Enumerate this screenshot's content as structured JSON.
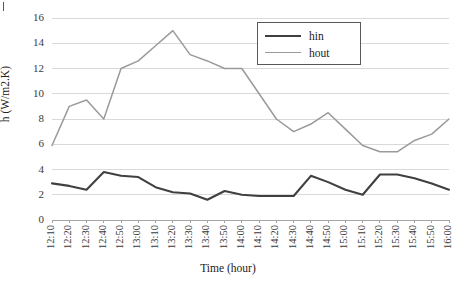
{
  "chart_data": {
    "type": "line",
    "title": "",
    "xlabel": "Time (hour)",
    "ylabel": "h (W/m2.K)",
    "ylim": [
      0,
      16
    ],
    "yticks": [
      0,
      2,
      4,
      6,
      8,
      10,
      12,
      14,
      16
    ],
    "grid": true,
    "legend_position": "top-right",
    "categories": [
      "12:10",
      "12:20",
      "12:30",
      "12:40",
      "12:50",
      "13:00",
      "13:10",
      "13:20",
      "13:30",
      "13:40",
      "13:50",
      "14:00",
      "14:10",
      "14:20",
      "14:30",
      "14:40",
      "14:50",
      "15:00",
      "15:10",
      "15:20",
      "15:30",
      "15:40",
      "15:50",
      "16:00"
    ],
    "series": [
      {
        "name": "hin",
        "color": "#404040",
        "values": [
          2.9,
          2.7,
          2.4,
          3.8,
          3.5,
          3.4,
          2.6,
          2.2,
          2.1,
          1.6,
          2.3,
          2.0,
          1.9,
          1.9,
          1.9,
          3.5,
          3.0,
          2.4,
          2.0,
          3.6,
          3.6,
          3.3,
          2.9,
          2.4
        ]
      },
      {
        "name": "hout",
        "color": "#9a9a9a",
        "values": [
          5.9,
          9.0,
          9.5,
          8.0,
          12.0,
          12.6,
          13.8,
          15.0,
          13.1,
          12.6,
          12.0,
          12.0,
          10.0,
          8.0,
          7.0,
          7.6,
          8.5,
          7.2,
          5.9,
          5.4,
          5.4,
          6.3,
          6.8,
          8.0
        ]
      }
    ]
  },
  "legend": {
    "items": [
      {
        "label": "hin"
      },
      {
        "label": "hout"
      }
    ]
  },
  "axes": {
    "y_title": "h (W/m2.K)",
    "x_title": "Time (hour)"
  },
  "colors": {
    "hin": "#404040",
    "hout": "#9a9a9a",
    "gridline": "#d9d9d9",
    "axis": "#a6a6a6",
    "text": "#222222"
  }
}
